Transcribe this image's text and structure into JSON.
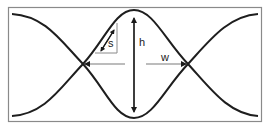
{
  "diagram": {
    "type": "crossing-sinusoidal-curves",
    "labels": {
      "height": "h",
      "width": "w",
      "slope": "s"
    },
    "colors": {
      "curve": "#1e1e1e",
      "frame": "#8a8a8a",
      "arrow_dark": "#1a1a1a",
      "arrow_gray": "#7a7a7a",
      "background": "#ffffff"
    }
  }
}
